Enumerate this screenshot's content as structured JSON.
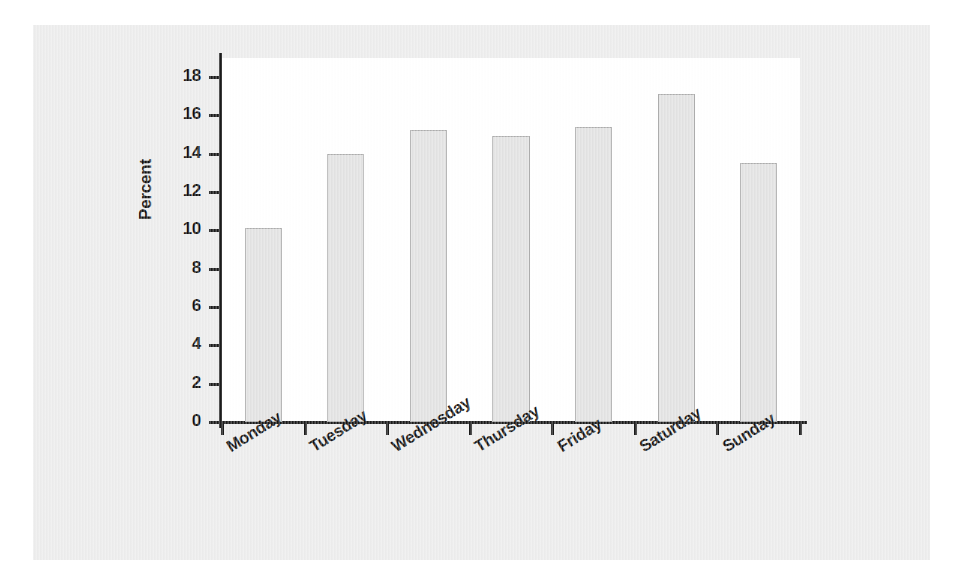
{
  "chart_data": {
    "type": "bar",
    "title": "",
    "subtitle": "",
    "xlabel": "",
    "ylabel": "Percent",
    "categories": [
      "Monday",
      "Tuesday",
      "Wednesday",
      "Thursday",
      "Friday",
      "Saturday",
      "Sunday"
    ],
    "values": [
      10.1,
      14.0,
      15.25,
      14.9,
      15.4,
      17.1,
      13.5
    ],
    "ylim": [
      0,
      18
    ],
    "yticks": [
      0,
      2,
      4,
      6,
      8,
      10,
      12,
      14,
      16,
      18
    ],
    "ytick_labels": [
      "0",
      "2",
      "4",
      "6",
      "8",
      "10",
      "12",
      "14",
      "16",
      "18"
    ],
    "grid": false,
    "legend": "none",
    "bar_fill_color": "#e2e2e2",
    "bar_edge_color": "#adadad",
    "axis_color": "#1a1a1a",
    "plot_background": "#ffffff",
    "figure_background": "#ececec",
    "xtick_label_rotation": "-32"
  },
  "axes": {
    "y_title": "Percent"
  }
}
